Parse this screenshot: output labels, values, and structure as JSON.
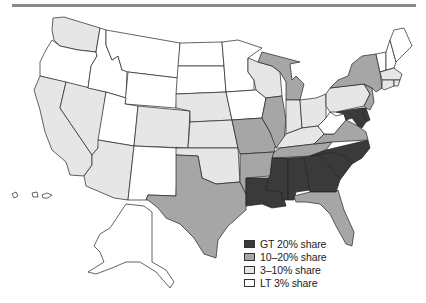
{
  "legend": {
    "title": "",
    "items": [
      {
        "key": "gt20",
        "label": "GT 20% share",
        "color": "#3a3a3a"
      },
      {
        "key": "p10_20",
        "label": "10–20% share",
        "color": "#a6a6a6"
      },
      {
        "key": "p3_10",
        "label": "3–10% share",
        "color": "#e6e6e6"
      },
      {
        "key": "lt3",
        "label": "LT 3% share",
        "color": "#ffffff"
      }
    ]
  },
  "states": {
    "WA": "p3_10",
    "OR": "lt3",
    "CA": "p3_10",
    "NV": "p3_10",
    "ID": "lt3",
    "MT": "lt3",
    "WY": "lt3",
    "UT": "lt3",
    "AZ": "p3_10",
    "CO": "p3_10",
    "NM": "lt3",
    "ND": "lt3",
    "SD": "lt3",
    "NE": "p3_10",
    "KS": "p3_10",
    "OK": "p3_10",
    "TX": "p10_20",
    "MN": "lt3",
    "IA": "lt3",
    "MO": "p10_20",
    "AR": "p10_20",
    "LA": "gt20",
    "WI": "p3_10",
    "IL": "p10_20",
    "MI": "p10_20",
    "IN": "p3_10",
    "OH": "p3_10",
    "KY": "p3_10",
    "TN": "p10_20",
    "MS": "gt20",
    "AL": "gt20",
    "GA": "gt20",
    "FL": "p10_20",
    "SC": "gt20",
    "NC": "gt20",
    "VA": "p10_20",
    "WV": "lt3",
    "MD": "gt20",
    "DE": "gt20",
    "NJ": "p10_20",
    "PA": "p3_10",
    "NY": "p10_20",
    "CT": "p3_10",
    "RI": "p3_10",
    "MA": "p3_10",
    "VT": "lt3",
    "NH": "lt3",
    "ME": "lt3",
    "AK": "lt3",
    "HI": "lt3",
    "DC": "gt20"
  }
}
